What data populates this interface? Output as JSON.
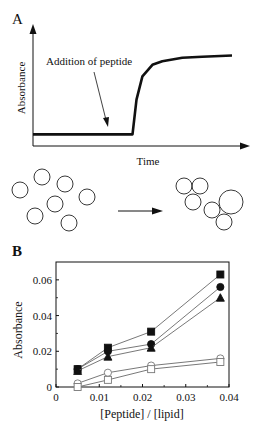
{
  "chart_data": [
    {
      "panel": "A",
      "type": "line",
      "title": "",
      "xlabel": "Time",
      "ylabel": "Absorbance",
      "annotation": "Addition of peptide",
      "description": "Schematic: absorbance flat baseline, then sharp rise after addition of peptide, plateauing",
      "x": [
        0,
        0.2,
        0.4,
        0.5,
        0.52,
        0.55,
        0.6,
        0.65,
        0.75,
        0.85,
        1.0
      ],
      "values": [
        0.1,
        0.1,
        0.1,
        0.1,
        0.4,
        0.6,
        0.7,
        0.73,
        0.76,
        0.77,
        0.78
      ],
      "xlim": [
        0,
        1
      ],
      "ylim": [
        0,
        1
      ],
      "grid": false
    },
    {
      "panel": "B",
      "type": "scatter",
      "title": "",
      "xlabel": "[Peptide] / [lipid]",
      "ylabel": "Absorbance",
      "xlim": [
        0,
        0.04
      ],
      "ylim": [
        0,
        0.07
      ],
      "xticks": [
        "0",
        "0.01",
        "0.02",
        "0.03",
        "0.04"
      ],
      "yticks": [
        "0",
        "0.02",
        "0.04",
        "0.06"
      ],
      "grid": false,
      "x": [
        0.005,
        0.012,
        0.022,
        0.038
      ],
      "series": [
        {
          "name": "filled-square",
          "marker": "square",
          "filled": true,
          "values": [
            0.01,
            0.022,
            0.031,
            0.063
          ]
        },
        {
          "name": "filled-circle",
          "marker": "circle",
          "filled": true,
          "values": [
            0.01,
            0.02,
            0.024,
            0.056
          ]
        },
        {
          "name": "filled-triangle",
          "marker": "triangle",
          "filled": true,
          "values": [
            0.009,
            0.017,
            0.022,
            0.05
          ]
        },
        {
          "name": "open-circle",
          "marker": "circle",
          "filled": false,
          "values": [
            0.002,
            0.008,
            0.012,
            0.016
          ]
        },
        {
          "name": "open-square",
          "marker": "square",
          "filled": false,
          "values": [
            0.0,
            0.004,
            0.01,
            0.014
          ]
        }
      ]
    }
  ],
  "labels": {
    "panel_a": "A",
    "panel_b": "B",
    "a_ylabel": "Absorbance",
    "a_xlabel": "Time",
    "a_annotation": "Addition of peptide",
    "b_ylabel": "Absorbance",
    "b_xlabel": "[Peptide] / [lipid]"
  },
  "vesicles": {
    "description": "Dispersed vesicles aggregate/fuse after peptide addition",
    "before_count": 8,
    "after_count": 7
  }
}
